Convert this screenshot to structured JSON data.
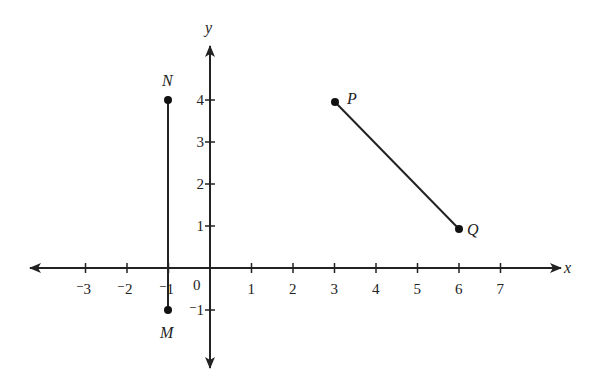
{
  "diagram": {
    "type": "coordinate-plane",
    "axes": {
      "x_label": "x",
      "y_label": "y",
      "origin_label": "0",
      "x_ticks": [
        {
          "value": -3,
          "label": "⁻3"
        },
        {
          "value": -2,
          "label": "⁻2"
        },
        {
          "value": -1,
          "label": "⁻1"
        },
        {
          "value": 1,
          "label": "1"
        },
        {
          "value": 2,
          "label": "2"
        },
        {
          "value": 3,
          "label": "3"
        },
        {
          "value": 4,
          "label": "4"
        },
        {
          "value": 5,
          "label": "5"
        },
        {
          "value": 6,
          "label": "6"
        },
        {
          "value": 7,
          "label": "7"
        }
      ],
      "y_ticks": [
        {
          "value": -1,
          "label": "⁻1"
        },
        {
          "value": 1,
          "label": "1"
        },
        {
          "value": 2,
          "label": "2"
        },
        {
          "value": 3,
          "label": "3"
        },
        {
          "value": 4,
          "label": "4"
        }
      ]
    },
    "points": [
      {
        "name": "N",
        "x": -1,
        "y": 4
      },
      {
        "name": "M",
        "x": -1,
        "y": -1
      },
      {
        "name": "P",
        "x": 3,
        "y": 4
      },
      {
        "name": "Q",
        "x": 6,
        "y": 1
      }
    ],
    "segments": [
      {
        "from": "N",
        "to": "M"
      },
      {
        "from": "P",
        "to": "Q"
      }
    ],
    "colors": {
      "ink": "#222222",
      "background": "#ffffff"
    }
  }
}
